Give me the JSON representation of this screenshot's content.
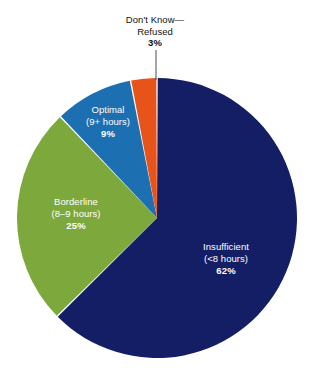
{
  "chart_data": {
    "type": "pie",
    "title": "",
    "subtitle": "",
    "xlabel": "",
    "ylabel": "",
    "legend_position": "none",
    "grid": false,
    "unit": "%",
    "start_angle_deg": 0,
    "direction": "clockwise",
    "categories": [
      "Insufficient (<8 hours)",
      "Borderline (8–9 hours)",
      "Optimal (9+ hours)",
      "Don't Know—Refused"
    ],
    "values": [
      62,
      25,
      9,
      3
    ],
    "colors": [
      "#141E64",
      "#7DA83C",
      "#1C6FB0",
      "#E8531A"
    ],
    "slices": [
      {
        "name": "Insufficient",
        "label_line1": "Insufficient",
        "label_line2": "(<8 hours)",
        "value": 62,
        "value_label": "62%",
        "color": "#141E64",
        "label_placement": "inside",
        "label_color": "#FFFFFF"
      },
      {
        "name": "Borderline",
        "label_line1": "Borderline",
        "label_line2": "(8–9 hours)",
        "value": 25,
        "value_label": "25%",
        "color": "#7DA83C",
        "label_placement": "inside",
        "label_color": "#FFFFFF"
      },
      {
        "name": "Optimal",
        "label_line1": "Optimal",
        "label_line2": "(9+ hours)",
        "value": 9,
        "value_label": "9%",
        "color": "#1C6FB0",
        "label_placement": "inside",
        "label_color": "#FFFFFF"
      },
      {
        "name": "Don't Know—Refused",
        "label_line1": "Don't Know—",
        "label_line2": "Refused",
        "value": 3,
        "value_label": "3%",
        "color": "#E8531A",
        "label_placement": "outside",
        "label_color": "#111111",
        "has_leader_line": true
      }
    ]
  },
  "figure": {
    "background_color": "#FFFFFF",
    "separator_color": "#FFFFFF"
  }
}
